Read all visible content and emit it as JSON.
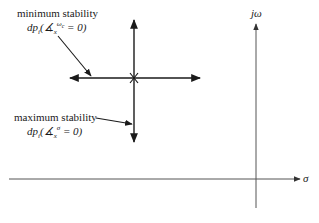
{
  "diagram": {
    "type": "s-plane root locus sensitivity directions",
    "axes": {
      "vertical_label": "jω",
      "horizontal_label": "σ"
    },
    "annotations": {
      "minimum_stability": {
        "title": "minimum stability",
        "formula_prefix": "dp",
        "formula_sub": "i",
        "formula_open": "(",
        "formula_symbol": "∡",
        "formula_symbol_sub": "x",
        "formula_symbol_sup": "ω",
        "formula_symbol_sup_sub": "c",
        "formula_tail": " = 0)"
      },
      "maximum_stability": {
        "title": "maximum stability",
        "formula_prefix": "dp",
        "formula_sub": "i",
        "formula_open": "(",
        "formula_symbol": "∡",
        "formula_symbol_sub": "x",
        "formula_symbol_sup": "σ",
        "formula_tail": " = 0)"
      }
    },
    "colors": {
      "ink": "#1a1a1a",
      "axis": "#555555",
      "background": "#ffffff"
    }
  }
}
